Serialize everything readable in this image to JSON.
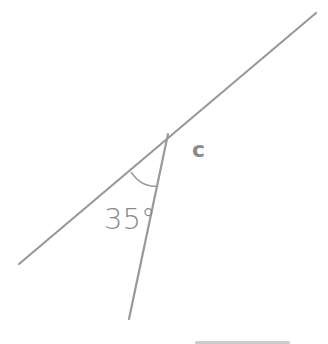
{
  "diagram": {
    "type": "angle-diagram",
    "colors": {
      "line": "#999999",
      "text": "#8a8a8a",
      "smudge": "#c8c8c8"
    },
    "long_line": {
      "x1": 19,
      "y1": 264,
      "x2": 316,
      "y2": 13
    },
    "short_line": {
      "x1": 168,
      "y1": 134,
      "x2": 129,
      "y2": 319
    },
    "vertex": {
      "x": 168,
      "y": 134
    },
    "angle_label": "35°",
    "vertex_label": "c"
  }
}
